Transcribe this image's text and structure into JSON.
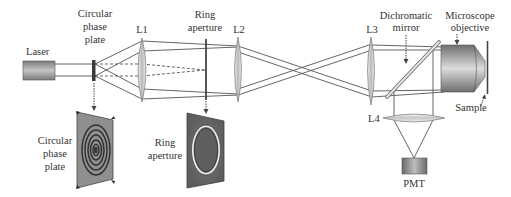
{
  "diagram": {
    "type": "optical-setup-schematic",
    "components": {
      "laser": {
        "label": "Laser"
      },
      "phase_plate": {
        "label_lines": [
          "Circular",
          "phase",
          "plate"
        ]
      },
      "lens1": {
        "label": "L1"
      },
      "ring_aperture": {
        "label_lines": [
          "Ring",
          "aperture"
        ]
      },
      "lens2": {
        "label": "L2"
      },
      "lens3": {
        "label": "L3"
      },
      "dichromatic_mirror": {
        "label_lines": [
          "Dichromatic",
          "mirror"
        ]
      },
      "objective": {
        "label_lines": [
          "Microscope",
          "objective"
        ]
      },
      "sample": {
        "label": "Sample"
      },
      "lens4": {
        "label": "L4"
      },
      "pmt": {
        "label": "PMT"
      }
    },
    "insets": {
      "phase_plate_detail": {
        "label_lines": [
          "Circular",
          "phase",
          "plate"
        ]
      },
      "ring_aperture_detail": {
        "label_lines": [
          "Ring",
          "aperture"
        ]
      }
    },
    "colors": {
      "line": "#555555",
      "component_gray": "#8a8a8a",
      "plate_dark": "#5a5a5a",
      "text": "#333333"
    }
  }
}
